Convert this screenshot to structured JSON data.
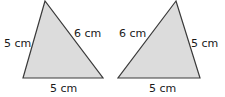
{
  "diagram": {
    "fill_color": "#dcdcdc",
    "stroke_color": "#3a3a3a",
    "triangles": [
      {
        "id": "left",
        "points": "45,1 23,78 103,78",
        "labels": {
          "left_side": "5 cm",
          "right_side": "6 cm",
          "base": "5 cm"
        }
      },
      {
        "id": "right",
        "points": "176,1 118,78 200,78",
        "labels": {
          "left_side": "6 cm",
          "right_side": "5 cm",
          "base": "5 cm"
        }
      }
    ]
  }
}
